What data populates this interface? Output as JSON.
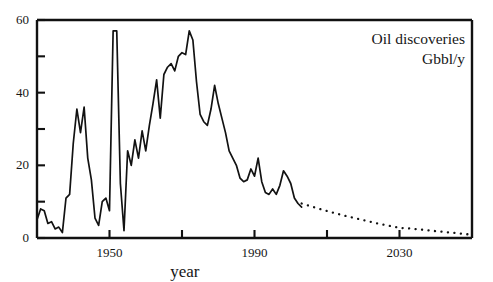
{
  "chart_data": {
    "type": "line",
    "title": "Oil discoveries",
    "subtitle": "Gbbl/y",
    "xlabel": "year",
    "ylabel": "",
    "xlim": [
      1930,
      2050
    ],
    "ylim": [
      0,
      60
    ],
    "grid": false,
    "legend": "none",
    "annotations": [
      {
        "text": "Oil discoveries",
        "position": "top-right"
      },
      {
        "text": "Gbbl/y",
        "position": "top-right"
      }
    ],
    "x_ticks_major": [
      1950,
      1990,
      2030
    ],
    "x_tick_labels": [
      "1950",
      "1990",
      "2030"
    ],
    "x_ticks_unlabeled": [
      1930,
      1970,
      2010,
      2050
    ],
    "y_ticks_major": [
      0,
      20,
      40,
      60
    ],
    "y_tick_labels": [
      "0",
      "20",
      "40",
      "60"
    ],
    "y_ticks_minor": [
      10,
      30,
      50
    ],
    "series": [
      {
        "name": "historical discoveries",
        "style": "solid",
        "x": [
          1930,
          1931,
          1932,
          1933,
          1934,
          1935,
          1936,
          1937,
          1938,
          1939,
          1940,
          1941,
          1942,
          1943,
          1944,
          1945,
          1946,
          1947,
          1948,
          1949,
          1950,
          1951,
          1952,
          1953,
          1954,
          1955,
          1956,
          1957,
          1958,
          1959,
          1960,
          1961,
          1962,
          1963,
          1964,
          1965,
          1966,
          1967,
          1968,
          1969,
          1970,
          1971,
          1972,
          1973,
          1974,
          1975,
          1976,
          1977,
          1978,
          1979,
          1980,
          1981,
          1982,
          1983,
          1984,
          1985,
          1986,
          1987,
          1988,
          1989,
          1990,
          1991,
          1992,
          1993,
          1994,
          1995,
          1996,
          1997,
          1998,
          1999,
          2000,
          2001,
          2002,
          2003
        ],
        "values": [
          5.0,
          8.0,
          7.5,
          4.0,
          4.5,
          2.5,
          3.0,
          1.5,
          11.0,
          12.0,
          26.0,
          35.5,
          29.0,
          36.0,
          22.0,
          16.0,
          5.5,
          3.5,
          10.0,
          11.0,
          7.5,
          57.0,
          57.0,
          15.0,
          2.0,
          24.0,
          20.0,
          27.0,
          22.0,
          29.5,
          24.0,
          31.0,
          37.0,
          43.5,
          33.0,
          45.0,
          47.0,
          48.0,
          46.0,
          50.0,
          51.0,
          50.5,
          57.0,
          54.5,
          43.0,
          34.0,
          32.0,
          31.0,
          35.5,
          42.0,
          37.0,
          33.0,
          29.0,
          24.0,
          22.0,
          20.0,
          16.5,
          15.5,
          16.0,
          19.0,
          17.0,
          22.0,
          15.5,
          12.5,
          12.0,
          13.5,
          12.0,
          14.5,
          18.5,
          17.0,
          15.0,
          11.0,
          9.5,
          8.5
        ]
      },
      {
        "name": "projected discoveries",
        "style": "dotted",
        "x": [
          2003,
          2006,
          2009,
          2012,
          2015,
          2018,
          2021,
          2024,
          2027,
          2030,
          2033,
          2036,
          2039,
          2042,
          2045,
          2048,
          2050
        ],
        "values": [
          9.5,
          8.6,
          7.7,
          6.9,
          6.1,
          5.4,
          4.7,
          4.0,
          3.4,
          2.8,
          2.6,
          2.3,
          2.0,
          1.7,
          1.4,
          1.1,
          0.9
        ]
      }
    ]
  },
  "axis": {
    "x_title": "year"
  }
}
